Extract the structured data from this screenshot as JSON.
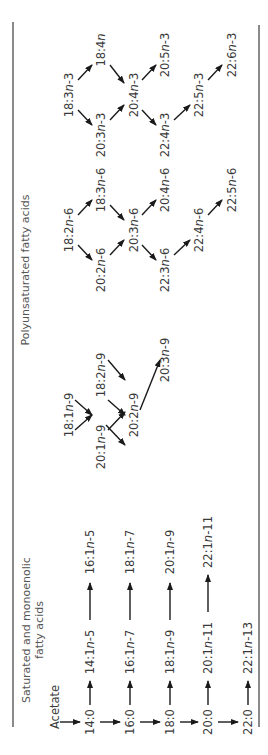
{
  "headers": {
    "saturated": [
      "Saturated and monoenolic",
      "fatty acids"
    ],
    "polyunsaturated": "Polyunsaturated fatty acids"
  },
  "nodes": {
    "acetate": "Acetate",
    "s14_0": "14:0",
    "s16_0": "16:0",
    "s18_0": "18:0",
    "s20_0": "20:0",
    "s22_0": "22:0",
    "m14_1n5": "14:1n-5",
    "m16_1n7": "16:1n-7",
    "m18_1n9": "18:1n-9",
    "m20_1n11": "20:1n-11",
    "m22_1n13": "22:1n-13",
    "m16_1n5": "16:1n-5",
    "m18_1n7": "18:1n-7",
    "m20_1n9": "20:1n-9",
    "m22_1n11": "22:1n-11",
    "n9_18_1": "18:1n-9",
    "n9_18_2": "18:2n-9",
    "n9_20_1": "20:1n-9",
    "n9_20_2": "20:2n-9",
    "n9_20_3": "20:3n-9",
    "n6_18_2": "18:2n-6",
    "n6_18_3": "18:3n-6",
    "n6_20_2": "20:2n-6",
    "n6_20_3": "20:3n-6",
    "n6_20_4": "20:4n-6",
    "n6_22_3": "22:3n-6",
    "n6_22_4": "22:4n-6",
    "n6_22_5": "22:5n-6",
    "n3_18_3": "18:3n-3",
    "n3_18_4": "18:4n",
    "n3_20_3": "20:3n-3",
    "n3_20_4": "20:4n-3",
    "n3_20_5": "20:5n-3",
    "n3_22_4": "22:4n-3",
    "n3_22_5": "22:5n-3",
    "n3_22_6": "22:6n-3"
  },
  "colors": {
    "text": "#3a3a3a",
    "arrow": "#1a1a1a",
    "rule": "#8a8a8a"
  }
}
